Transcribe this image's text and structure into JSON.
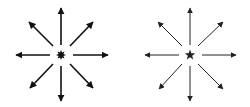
{
  "figures": [
    {
      "name": "starburst-radiating-arrows",
      "center": [
        61,
        55
      ],
      "center_symbol": "starburst",
      "stroke_width": 1.6,
      "color": "#111111",
      "arrows": [
        {
          "dir": "up",
          "from": [
            61,
            45
          ],
          "to": [
            61,
            8
          ]
        },
        {
          "dir": "down",
          "from": [
            61,
            66
          ],
          "to": [
            61,
            101
          ]
        },
        {
          "dir": "left",
          "from": [
            50,
            55
          ],
          "to": [
            16,
            55
          ]
        },
        {
          "dir": "right",
          "from": [
            73,
            55
          ],
          "to": [
            108,
            55
          ]
        },
        {
          "dir": "up-left",
          "from": [
            53,
            46
          ],
          "to": [
            29,
            22
          ]
        },
        {
          "dir": "up-right",
          "from": [
            70,
            46
          ],
          "to": [
            93,
            22
          ]
        },
        {
          "dir": "down-left",
          "from": [
            53,
            64
          ],
          "to": [
            30,
            88
          ]
        },
        {
          "dir": "down-right",
          "from": [
            70,
            64
          ],
          "to": [
            93,
            88
          ]
        }
      ]
    },
    {
      "name": "star-radiating-arrows",
      "center": [
        190,
        55
      ],
      "center_symbol": "five-point-star",
      "stroke_width": 1.0,
      "color": "#222222",
      "arrows": [
        {
          "dir": "up",
          "from": [
            190,
            45
          ],
          "to": [
            190,
            8
          ]
        },
        {
          "dir": "down",
          "from": [
            190,
            66
          ],
          "to": [
            190,
            101
          ]
        },
        {
          "dir": "left",
          "from": [
            179,
            55
          ],
          "to": [
            145,
            55
          ]
        },
        {
          "dir": "right",
          "from": [
            202,
            55
          ],
          "to": [
            236,
            55
          ]
        },
        {
          "dir": "up-left",
          "from": [
            182,
            46
          ],
          "to": [
            158,
            22
          ]
        },
        {
          "dir": "up-right",
          "from": [
            198,
            46
          ],
          "to": [
            223,
            22
          ]
        },
        {
          "dir": "down-left",
          "from": [
            182,
            64
          ],
          "to": [
            159,
            89
          ]
        },
        {
          "dir": "down-right",
          "from": [
            198,
            64
          ],
          "to": [
            223,
            89
          ]
        }
      ]
    }
  ]
}
